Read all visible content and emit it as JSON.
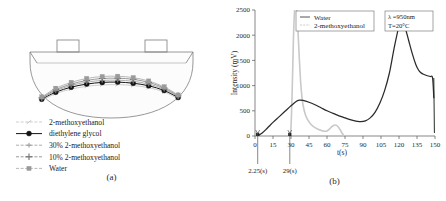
{
  "figure": {
    "panel_a": {
      "caption": "(a)",
      "legend": [
        {
          "label": "2-methoxyethanol",
          "marker": "tick-marker",
          "color": "#b9b9b9"
        },
        {
          "label": "diethylene glycol",
          "marker": "filled-circle",
          "color": "#141414"
        },
        {
          "label": "30% 2-methoxyethanol",
          "marker": "small-plus",
          "color": "#8d8d8d"
        },
        {
          "label": "10% 2-methoxyethanol",
          "marker": "large-plus",
          "color": "#6e6e6e"
        },
        {
          "label": "Water",
          "marker": "filled-square",
          "color": "#9a9a9a"
        }
      ]
    },
    "panel_b": {
      "caption": "(b)",
      "legend": [
        {
          "label": "Water",
          "color": "#2a2a2a"
        },
        {
          "label": "2-methoxyethanol",
          "color": "#c9c9c9"
        }
      ],
      "annotation": {
        "wavelength": "λ =950nm",
        "temperature": "T=20°C"
      },
      "markers": [
        {
          "label": "2.25(s)",
          "t": 2.25
        },
        {
          "label": "29(s)",
          "t": 29
        }
      ]
    }
  },
  "chart_data": [
    {
      "id": "panel-a",
      "type": "line",
      "title": "",
      "xlabel": "",
      "ylabel": "",
      "xlim": [
        0,
        100
      ],
      "ylim": [
        0,
        100
      ],
      "grid": false,
      "legend_position": "lower-left",
      "note": "Cross-sectional free-surface profiles inside a vessel; curved meniscus/deformation shapes for five liquids",
      "x": [
        5,
        14,
        24,
        34,
        44,
        54,
        64,
        74,
        84,
        93
      ],
      "series": [
        {
          "name": "2-methoxyethanol",
          "color": "#b9b9b9",
          "marker": "tick-marker",
          "values": [
            72,
            60,
            52,
            47,
            44.5,
            44,
            45.5,
            49.5,
            57,
            69
          ]
        },
        {
          "name": "diethylene glycol",
          "color": "#141414",
          "marker": "filled-circle",
          "values": [
            70,
            57.5,
            48.5,
            43,
            40,
            39.5,
            41.5,
            46,
            54.5,
            67
          ]
        },
        {
          "name": "30% 2-methoxyethanol",
          "color": "#8d8d8d",
          "marker": "small-plus",
          "values": [
            68.5,
            55,
            45.5,
            39.5,
            36.5,
            36,
            38,
            43,
            52,
            65.5
          ]
        },
        {
          "name": "10% 2-methoxyethanol",
          "color": "#6e6e6e",
          "marker": "large-plus",
          "values": [
            67.5,
            53,
            43,
            36.5,
            33,
            32.5,
            34.5,
            40,
            50,
            64
          ]
        },
        {
          "name": "Water",
          "color": "#9a9a9a",
          "marker": "filled-square",
          "values": [
            66,
            50.5,
            40,
            33,
            29.5,
            29,
            31.5,
            37.5,
            48,
            62.5
          ]
        }
      ]
    },
    {
      "id": "panel-b",
      "type": "line",
      "title": "",
      "xlabel": "t(s)",
      "ylabel": "Intensity (mV)",
      "xlim": [
        0,
        150
      ],
      "ylim": [
        0,
        2500
      ],
      "xticks": [
        0,
        15,
        30,
        45,
        60,
        75,
        90,
        105,
        120,
        135,
        150
      ],
      "yticks": [
        0,
        500,
        1000,
        1500,
        2000,
        2500
      ],
      "grid": false,
      "legend_position": "top-center",
      "annotations": [
        "λ =950nm",
        "T=20°C",
        "2.25(s)",
        "29(s)"
      ],
      "series": [
        {
          "name": "Water",
          "color": "#2a2a2a",
          "x": [
            2.25,
            6,
            10,
            15,
            20,
            25,
            30,
            34,
            37,
            40,
            45,
            50,
            55,
            60,
            65,
            70,
            75,
            80,
            85,
            88,
            92,
            96,
            100,
            104,
            108,
            112,
            116,
            120,
            122,
            125,
            128,
            131,
            134,
            136,
            138,
            140,
            143,
            146,
            148,
            149
          ],
          "y": [
            0,
            60,
            150,
            270,
            380,
            490,
            600,
            680,
            710,
            705,
            670,
            620,
            560,
            500,
            450,
            400,
            360,
            320,
            292,
            283,
            300,
            360,
            470,
            650,
            900,
            1250,
            1750,
            2180,
            2230,
            2150,
            1900,
            1640,
            1420,
            1320,
            1260,
            1230,
            1200,
            1180,
            1150,
            760
          ]
        },
        {
          "name": "2-methoxyethanol",
          "color": "#c9c9c9",
          "x": [
            29,
            30,
            31,
            32,
            33,
            34,
            35,
            36,
            37,
            38,
            39,
            40,
            42,
            44,
            46,
            48,
            50,
            53,
            56,
            58,
            60,
            62,
            64,
            66,
            68,
            70,
            72,
            74
          ],
          "y": [
            0,
            180,
            900,
            1900,
            2500,
            2620,
            2450,
            2000,
            1500,
            1080,
            800,
            620,
            420,
            320,
            250,
            200,
            165,
            130,
            105,
            95,
            100,
            135,
            185,
            215,
            210,
            160,
            80,
            10
          ]
        }
      ]
    }
  ]
}
